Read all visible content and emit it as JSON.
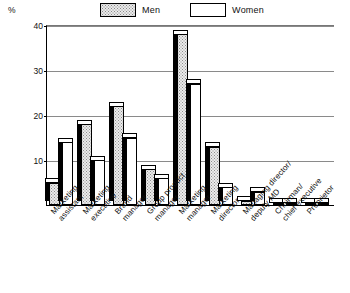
{
  "chart_data": {
    "type": "bar",
    "title": "",
    "xlabel": "",
    "ylabel": "%",
    "ylim": [
      0,
      40
    ],
    "yticks": [
      10,
      20,
      30,
      40
    ],
    "grid": true,
    "legend_position": "top",
    "categories": [
      "Marketing\nassistant",
      "Marketing\nexecutive",
      "Brand\nmanager",
      "Group product\nmanager",
      "Marketing\nmanager",
      "Marketing\ndirector",
      "Managing director/\ndeputy MD",
      "Chairman/\nchief executive",
      "Proprietor"
    ],
    "series": [
      {
        "name": "Men",
        "values": [
          5,
          18,
          22,
          8,
          38,
          13,
          1,
          0.5,
          0.5
        ]
      },
      {
        "name": "Women",
        "values": [
          14,
          10,
          15,
          6,
          27,
          4,
          3,
          0.5,
          0.5
        ]
      }
    ]
  },
  "axis": {
    "y_unit_label": "%",
    "tick_labels": [
      "40",
      "30",
      "20",
      "10"
    ]
  },
  "legend": {
    "entries": [
      {
        "label": "Men",
        "swatch": "stippled-grey"
      },
      {
        "label": "Women",
        "swatch": "white"
      }
    ]
  }
}
